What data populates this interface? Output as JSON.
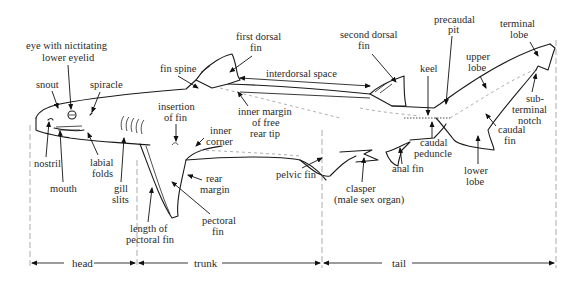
{
  "diagram": {
    "labels": {
      "eye": [
        "eye with nictitating",
        "lower eyelid"
      ],
      "snout": "snout",
      "spiracle": "spiracle",
      "nostril": "nostril",
      "mouth": "mouth",
      "labial_folds": [
        "labial",
        "folds"
      ],
      "gill_slits": [
        "gill",
        "slits"
      ],
      "fin_spine": "fin spine",
      "first_dorsal_fin": [
        "first dorsal",
        "fin"
      ],
      "interdorsal_space": "interdorsal space",
      "inner_margin": [
        "inner margin",
        "of free",
        "rear tip"
      ],
      "insertion_of_fin": [
        "insertion",
        "of fin"
      ],
      "inner_corner": [
        "inner",
        "corner"
      ],
      "rear_margin": [
        "rear",
        "margin"
      ],
      "pectoral_fin": [
        "pectoral",
        "fin"
      ],
      "length_of_pectoral_fin": [
        "length of",
        "pectoral fin"
      ],
      "pelvic_fin": "pelvic fin",
      "second_dorsal_fin": [
        "second dorsal",
        "fin"
      ],
      "keel": "keel",
      "precaudal_pit": [
        "precaudal",
        "pit"
      ],
      "terminal_lobe": [
        "terminal",
        "lobe"
      ],
      "upper_lobe": [
        "upper",
        "lobe"
      ],
      "subterminal_notch": [
        "sub-",
        "terminal",
        "notch"
      ],
      "caudal_fin": [
        "caudal",
        "fin"
      ],
      "caudal_peduncle": [
        "caudal",
        "peduncle"
      ],
      "anal_fin": "anal fin",
      "lower_lobe": [
        "lower",
        "lobe"
      ],
      "clasper": [
        "clasper",
        "(male sex organ)"
      ]
    },
    "regions": [
      {
        "name": "head",
        "label": "head"
      },
      {
        "name": "trunk",
        "label": "trunk"
      },
      {
        "name": "tail",
        "label": "tail"
      }
    ],
    "colors": {
      "line": "#1a1a1a",
      "text": "#2a2a2a",
      "guide": "#888888",
      "background": "#ffffff"
    }
  }
}
